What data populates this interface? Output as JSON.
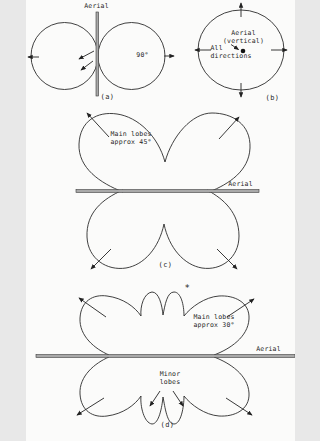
{
  "figure": {
    "colors": {
      "line": "#2b2b2b",
      "bar_fill": "#a9a9a9",
      "background": "#fbfbfa",
      "text": "#1f1f1f"
    },
    "panel_a": {
      "aerial_label": "Aerial",
      "angle_label": "90°",
      "caption": "(a)"
    },
    "panel_b": {
      "aerial_label": "Aerial\n(vertical)",
      "all_directions_label": "All\ndirections",
      "caption": "(b)"
    },
    "panel_c": {
      "main_lobes_label": "Main lobes\napprox 45°",
      "aerial_label": "Aerial",
      "caption": "(c)"
    },
    "panel_d": {
      "asterisk": "*",
      "main_lobes_label": "Main lobes\napprox 30°",
      "minor_lobes_label": "Minor\nlobes",
      "aerial_label": "Aerial",
      "caption": "(d)"
    }
  }
}
